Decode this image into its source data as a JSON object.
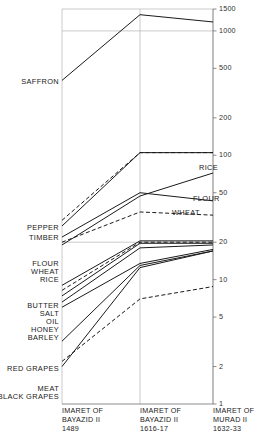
{
  "chart_data": {
    "type": "line",
    "title": "",
    "subtitle": "",
    "xlabel": "",
    "ylabel": "",
    "scale": "log",
    "grid": true,
    "legend_position": "inline-labels",
    "categories": [
      "IMARET OF BAYAZID II 1489",
      "IMARET OF BAYAZID II 1616-17",
      "IMARET OF MURAD II 1632-33"
    ],
    "x_tick_labels": [
      {
        "line1": "IMARET OF",
        "line2": "BAYAZID II",
        "line3": "1489"
      },
      {
        "line1": "IMARET OF",
        "line2": "BAYAZID II",
        "line3": "1616-17"
      },
      {
        "line1": "IMARET OF",
        "line2": "MURAD II",
        "line3": "1632-33"
      }
    ],
    "y_ticks": [
      1,
      2,
      5,
      10,
      20,
      50,
      100,
      200,
      500,
      1000,
      1500
    ],
    "y_tick_labels": [
      "1",
      "2",
      "5",
      "10",
      "20",
      "50",
      "100",
      "200",
      "500",
      "1000",
      "1500"
    ],
    "ylim": [
      1,
      1500
    ],
    "gridlines_at": [
      1000,
      20
    ],
    "series": [
      {
        "name": "SAFFRON",
        "style": "solid",
        "values": [
          400,
          1350,
          1180
        ],
        "label_left": "SAFFRON",
        "label_right": ""
      },
      {
        "name": "PEPPER",
        "style": "dashed",
        "values": [
          30,
          105,
          105
        ],
        "label_left": "PEPPER",
        "label_right": ""
      },
      {
        "name": "TIMBER",
        "style": "solid",
        "values": [
          27,
          105,
          105
        ],
        "label_left": "TIMBER",
        "label_right": ""
      },
      {
        "name": "RICE",
        "style": "solid",
        "values": [
          19,
          47,
          72
        ],
        "label_left": "RICE",
        "label_right": "RICE"
      },
      {
        "name": "FLOUR",
        "style": "solid",
        "values": [
          22,
          50,
          43
        ],
        "label_left": "FLOUR",
        "label_right": "FLOUR"
      },
      {
        "name": "WHEAT",
        "style": "dashed",
        "values": [
          20,
          35,
          33
        ],
        "label_left": "WHEAT",
        "label_right": "WHEAT"
      },
      {
        "name": "BUTTER",
        "style": "solid",
        "values": [
          9.0,
          20.5,
          20.5
        ],
        "label_left": "BUTTER",
        "label_right": ""
      },
      {
        "name": "SALT",
        "style": "dashed",
        "values": [
          8.2,
          20.0,
          20.0
        ],
        "label_left": "SALT",
        "label_right": ""
      },
      {
        "name": "OIL",
        "style": "solid",
        "values": [
          7.4,
          19.6,
          19.6
        ],
        "label_left": "OIL",
        "label_right": ""
      },
      {
        "name": "HONEY",
        "style": "solid",
        "values": [
          6.6,
          18.0,
          19.0
        ],
        "label_left": "HONEY",
        "label_right": ""
      },
      {
        "name": "BARLEY",
        "style": "solid",
        "values": [
          6.0,
          13.5,
          17.5
        ],
        "label_left": "BARLEY",
        "label_right": ""
      },
      {
        "name": "RED GRAPES",
        "style": "solid",
        "values": [
          3.2,
          13.0,
          17.0
        ],
        "label_left": "RED GRAPES",
        "label_right": ""
      },
      {
        "name": "MEAT",
        "style": "dashed",
        "values": [
          2.2,
          7.0,
          8.8
        ],
        "label_left": "MEAT",
        "label_right": ""
      },
      {
        "name": "BLACK GRAPES",
        "style": "solid",
        "values": [
          2.0,
          12.5,
          17.0
        ],
        "label_left": "BLACK GRAPES",
        "label_right": ""
      }
    ]
  },
  "axis": {
    "tick_1": "1",
    "tick_2": "2",
    "tick_5": "5",
    "tick_10": "10",
    "tick_20": "20",
    "tick_50": "50",
    "tick_100": "100",
    "tick_200": "200",
    "tick_500": "500",
    "tick_1000": "1000",
    "tick_1500": "1500"
  },
  "left_labels": {
    "saffron": "SAFFRON",
    "pepper": "PEPPER",
    "timber": "TIMBER",
    "flour": "FLOUR",
    "wheat": "WHEAT",
    "rice": "RICE",
    "butter": "BUTTER",
    "salt": "SALT",
    "oil": "OIL",
    "honey": "HONEY",
    "barley": "BARLEY",
    "red_grapes": "RED GRAPES",
    "meat": "MEAT",
    "black_grapes": "BLACK GRAPES"
  },
  "right_labels": {
    "rice": "RICE",
    "flour": "FLOUR",
    "wheat": "WHEAT"
  },
  "xcats": {
    "c1l1": "IMARET OF",
    "c1l2": "BAYAZID II",
    "c1l3": "1489",
    "c2l1": "IMARET OF",
    "c2l2": "BAYAZID II",
    "c2l3": "1616-17",
    "c3l1": "IMARET OF",
    "c3l2": "MURAD II",
    "c3l3": "1632-33"
  },
  "colors": {
    "line": "#1a1a1a",
    "axis": "#707070",
    "grid": "#b5b5b5",
    "text": "#1a1a1a",
    "background": "#ffffff"
  }
}
